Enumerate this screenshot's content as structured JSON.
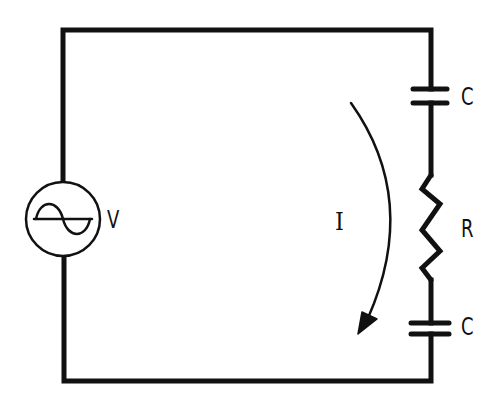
{
  "diagram": {
    "type": "series RC circuit with AC voltage source",
    "colors": {
      "background": "#ffffff",
      "ink": "#111111"
    },
    "components": [
      {
        "id": "source",
        "kind": "ac-voltage-source",
        "label": "V"
      },
      {
        "id": "cap_top",
        "kind": "capacitor",
        "label": "C"
      },
      {
        "id": "resistor",
        "kind": "resistor",
        "label": "R"
      },
      {
        "id": "cap_bottom",
        "kind": "capacitor",
        "label": "C"
      }
    ],
    "current": {
      "label": "I",
      "direction": "clockwise-down-right-branch"
    }
  },
  "labels": {
    "source": "V",
    "cap_top": "C",
    "resistor": "R",
    "cap_bottom": "C",
    "current": "I"
  }
}
